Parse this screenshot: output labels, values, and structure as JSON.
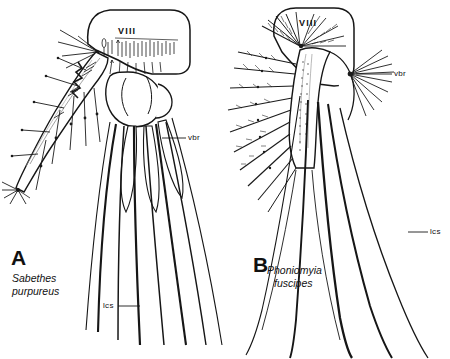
{
  "figure": {
    "type": "scientific-line-drawing-plate",
    "background_color": "#ffffff",
    "ink_color": "#1a1a1a",
    "panel_count": 2
  },
  "panels": [
    {
      "id": "A",
      "letter": "A",
      "genus": "Sabethes",
      "species": "purpureus",
      "segment_label": "VIII",
      "annotations": [
        {
          "key": "vbr",
          "text": "vbr"
        },
        {
          "key": "lcs",
          "text": "lcs"
        }
      ]
    },
    {
      "id": "B",
      "letter": "B",
      "genus": "Phoniomyia",
      "species": "fuscipes",
      "segment_label": "VIII",
      "annotations": [
        {
          "key": "vbr",
          "text": "vbr"
        },
        {
          "key": "lcs",
          "text": "lcs"
        }
      ]
    }
  ],
  "labels": {
    "a_letter": "A",
    "a_genus": "Sabethes",
    "a_species": "purpureus",
    "a_segment": "VIII",
    "a_vbr": "vbr",
    "a_lcs": "lcs",
    "b_letter": "B",
    "b_genus": "Phoniomyia",
    "b_species": "fuscipes",
    "b_segment": "VIII",
    "b_vbr": "vbr",
    "b_lcs": "lcs"
  }
}
